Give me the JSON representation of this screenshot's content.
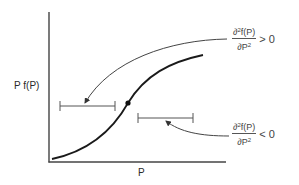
{
  "diagram": {
    "y_axis_label": "P f(P)",
    "x_axis_label": "P",
    "upper_annotation": {
      "numerator_prefix": "∂",
      "numerator_exp": "2",
      "numerator_suffix": "f(P)",
      "denominator_prefix": "∂P",
      "denominator_exp": "2",
      "relation": "> 0"
    },
    "lower_annotation": {
      "numerator_prefix": "∂",
      "numerator_exp": "2",
      "numerator_suffix": "f(P)",
      "denominator_prefix": "∂P",
      "denominator_exp": "2",
      "relation": "< 0"
    },
    "colors": {
      "axis": "#333333",
      "curve": "#1a1a1a",
      "bracket": "#555555",
      "arrow": "#444444"
    }
  }
}
